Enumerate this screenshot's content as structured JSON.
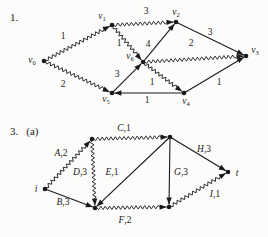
{
  "page": {
    "background": "#fcfcfa",
    "ink": "#1a1a1a"
  },
  "figure1": {
    "section_label": "1.",
    "nodes": [
      {
        "id": "v0",
        "x": 44,
        "y": 61,
        "label": "v",
        "sub": "0",
        "lx": 32,
        "ly": 63
      },
      {
        "id": "v1",
        "x": 112,
        "y": 25,
        "label": "v",
        "sub": "1",
        "lx": 102,
        "ly": 19
      },
      {
        "id": "v2",
        "x": 176,
        "y": 22,
        "label": "v",
        "sub": "2",
        "lx": 176,
        "ly": 15
      },
      {
        "id": "v3",
        "x": 246,
        "y": 56,
        "label": "v",
        "sub": "3",
        "lx": 255,
        "ly": 53
      },
      {
        "id": "v4",
        "x": 184,
        "y": 93,
        "label": "v",
        "sub": "4",
        "lx": 186,
        "ly": 104
      },
      {
        "id": "v5",
        "x": 112,
        "y": 93,
        "label": "v",
        "sub": "5",
        "lx": 106,
        "ly": 102
      },
      {
        "id": "v6",
        "x": 143,
        "y": 62,
        "label": "v",
        "sub": "6",
        "lx": 130,
        "ly": 59
      }
    ],
    "edges": [
      {
        "from": "v0",
        "to": "v1",
        "style": "wavy",
        "label": "1",
        "lx": 63,
        "ly": 39
      },
      {
        "from": "v0",
        "to": "v5",
        "style": "wavy",
        "label": "2",
        "lx": 63,
        "ly": 87
      },
      {
        "from": "v1",
        "to": "v2",
        "style": "wavy",
        "label": "3",
        "lx": 146,
        "ly": 14
      },
      {
        "from": "v1",
        "to": "v6",
        "style": "wavy",
        "label": "1",
        "lx": 119,
        "ly": 46
      },
      {
        "from": "v6",
        "to": "v2",
        "style": "straight",
        "label": "4",
        "lx": 148,
        "ly": 47
      },
      {
        "from": "v5",
        "to": "v6",
        "style": "straight",
        "label": "3",
        "lx": 117,
        "ly": 77
      },
      {
        "from": "v6",
        "to": "v3",
        "style": "wavy",
        "label": "2",
        "lx": 191,
        "ly": 46
      },
      {
        "from": "v6",
        "to": "v4",
        "style": "wavy",
        "label": "1",
        "lx": 152,
        "ly": 85
      },
      {
        "from": "v2",
        "to": "v3",
        "style": "straight",
        "label": "3",
        "lx": 210,
        "ly": 35
      },
      {
        "from": "v4",
        "to": "v3",
        "style": "straight",
        "label": "1",
        "lx": 219,
        "ly": 85
      },
      {
        "from": "v4",
        "to": "v5",
        "style": "straight",
        "label": "1",
        "lx": 147,
        "ly": 103
      }
    ]
  },
  "figure2": {
    "section_label": "3.",
    "sub_label": "(a)",
    "nodes": [
      {
        "id": "i",
        "x": 45,
        "y": 189,
        "label": "i",
        "lx": 36,
        "ly": 192
      },
      {
        "id": "n1",
        "x": 92,
        "y": 139
      },
      {
        "id": "n2",
        "x": 170,
        "y": 137
      },
      {
        "id": "n3",
        "x": 95,
        "y": 208
      },
      {
        "id": "n4",
        "x": 169,
        "y": 207
      },
      {
        "id": "t",
        "x": 228,
        "y": 172,
        "label": "t",
        "lx": 237,
        "ly": 176
      }
    ],
    "edges": [
      {
        "id": "A",
        "from": "i",
        "to": "n1",
        "style": "wavy",
        "label": "A,2",
        "lx": 61,
        "ly": 156
      },
      {
        "id": "B",
        "from": "i",
        "to": "n3",
        "style": "straight",
        "label": "B,3",
        "lx": 63,
        "ly": 205
      },
      {
        "id": "C",
        "from": "n1",
        "to": "n2",
        "style": "wavy",
        "label": "C,1",
        "lx": 124,
        "ly": 131
      },
      {
        "id": "D",
        "from": "n1",
        "to": "n3",
        "style": "wavy",
        "label": "D,3",
        "lx": 80,
        "ly": 175
      },
      {
        "id": "E",
        "from": "n2",
        "to": "n3",
        "style": "straight",
        "label": "E,1",
        "lx": 112,
        "ly": 175
      },
      {
        "id": "G",
        "from": "n2",
        "to": "n4",
        "style": "straight",
        "label": "G,3",
        "lx": 181,
        "ly": 175
      },
      {
        "id": "H",
        "from": "n2",
        "to": "t",
        "style": "straight",
        "label": "H,3",
        "lx": 204,
        "ly": 152
      },
      {
        "id": "F",
        "from": "n3",
        "to": "n4",
        "style": "wavy",
        "label": "F,2",
        "lx": 125,
        "ly": 223
      },
      {
        "id": "I",
        "from": "n4",
        "to": "t",
        "style": "wavy",
        "label": "I,1",
        "lx": 215,
        "ly": 197
      }
    ]
  }
}
